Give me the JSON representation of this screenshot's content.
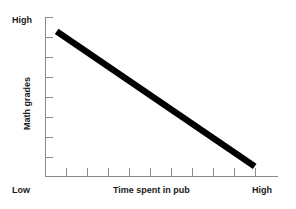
{
  "chart_data": {
    "type": "line",
    "title": "",
    "subtitle": "",
    "xlabel": "Time spent in pub",
    "ylabel": "Math grades",
    "x_tick_labels": [
      "Low",
      "High"
    ],
    "y_tick_labels": [
      "Low",
      "High"
    ],
    "xlim": [
      0,
      10
    ],
    "ylim": [
      0,
      10
    ],
    "grid": false,
    "legend": "none",
    "x_tick_count": 10,
    "y_tick_count": 8,
    "series": [
      {
        "name": "Math grades vs time spent in pub",
        "x": [
          0.5,
          9.0
        ],
        "values": [
          9.1,
          0.6
        ],
        "color": "#000000",
        "linewidth": 6.4,
        "annotation": "Strong negative correlation"
      }
    ],
    "axis_color": "#8a8a8a",
    "background": "#ffffff"
  },
  "labels": {
    "y_high": "High",
    "y_low": "Low",
    "x_high": "High",
    "x_title": "Time spent in pub",
    "y_title": "Math grades"
  }
}
